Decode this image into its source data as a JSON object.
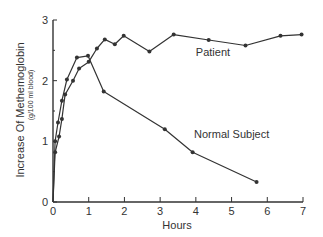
{
  "chart_data": {
    "type": "line",
    "title": "",
    "xlabel": "Hours",
    "ylabel": "Increase Of Methemoglobin",
    "ylabel_sub": "(g/100 ml blood)",
    "xlim": [
      0,
      7
    ],
    "ylim": [
      0,
      3
    ],
    "x_ticks": [
      "0",
      "1",
      "2",
      "3",
      "4",
      "5",
      "6",
      "7"
    ],
    "y_ticks": [
      "0",
      "1",
      "2",
      "3"
    ],
    "grid": false,
    "legend": "inline labels",
    "series": [
      {
        "name": "Patient",
        "label_position": {
          "x": 4.0,
          "y": 2.4
        },
        "points": [
          [
            0,
            0
          ],
          [
            0.06,
            0.82
          ],
          [
            0.17,
            1.08
          ],
          [
            0.25,
            1.37
          ],
          [
            0.34,
            1.77
          ],
          [
            0.56,
            2.0
          ],
          [
            0.73,
            2.2
          ],
          [
            1.0,
            2.31
          ],
          [
            1.23,
            2.53
          ],
          [
            1.45,
            2.68
          ],
          [
            1.73,
            2.6
          ],
          [
            1.98,
            2.74
          ],
          [
            2.7,
            2.48
          ],
          [
            3.38,
            2.76
          ],
          [
            4.36,
            2.67
          ],
          [
            5.39,
            2.58
          ],
          [
            6.37,
            2.74
          ],
          [
            6.96,
            2.76
          ]
        ]
      },
      {
        "name": "Normal Subject",
        "label_position": {
          "x": 3.95,
          "y": 1.05
        },
        "points": [
          [
            0,
            0
          ],
          [
            0.06,
            1.0
          ],
          [
            0.14,
            1.31
          ],
          [
            0.25,
            1.67
          ],
          [
            0.39,
            2.02
          ],
          [
            0.67,
            2.38
          ],
          [
            0.98,
            2.41
          ],
          [
            1.42,
            1.82
          ],
          [
            3.13,
            1.2
          ],
          [
            3.91,
            0.82
          ],
          [
            5.7,
            0.33
          ]
        ]
      }
    ]
  },
  "colors": {
    "line": "#333333",
    "axis": "#333333",
    "background": "#ffffff"
  }
}
